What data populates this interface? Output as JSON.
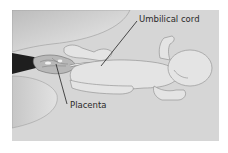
{
  "diagram": {
    "labels": [
      {
        "id": "umbilical-cord",
        "text": "Umbilical cord"
      },
      {
        "id": "placenta",
        "text": "Placenta"
      }
    ],
    "colors": {
      "background": "#d6d6d6",
      "page": "#ffffff",
      "body_fill": "#e4e4e4",
      "outline": "#8a8a8a",
      "dark_tissue": "#1e1e1e",
      "leader_line": "#222222",
      "text": "#2a2a2a"
    }
  }
}
